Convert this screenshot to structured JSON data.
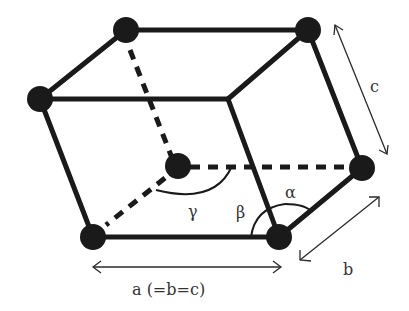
{
  "diagram": {
    "type": "rhombohedral unit cell",
    "labels": {
      "a": "a (=b=c)",
      "b": "b",
      "c": "c",
      "alpha": "α",
      "beta": "β",
      "gamma": "γ"
    },
    "colors": {
      "edge": "#1a1a1a",
      "atom": "#1a1a1a",
      "text": "#333333",
      "background": "#ffffff"
    }
  }
}
